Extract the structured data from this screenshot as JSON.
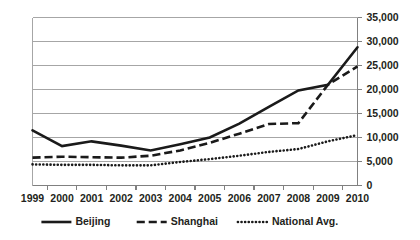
{
  "chart_data": {
    "type": "line",
    "title": "",
    "subtitle": "",
    "xlabel": "",
    "ylabel": "",
    "categories": [
      "1999",
      "2000",
      "2001",
      "2002",
      "2003",
      "2004",
      "2005",
      "2006",
      "2007",
      "2008",
      "2009",
      "2010"
    ],
    "ylim": [
      0,
      35000
    ],
    "ytick_values": [
      0,
      5000,
      10000,
      15000,
      20000,
      25000,
      30000,
      35000
    ],
    "ytick_labels": [
      "0",
      "5,000",
      "10,000",
      "15,000",
      "20,000",
      "25,000",
      "30,000",
      "35,000"
    ],
    "yaxis_position": "right",
    "grid": true,
    "grid_axis": "y",
    "legend_position": "bottom",
    "series": [
      {
        "name": "Beijing",
        "style": "solid",
        "color": "#1a1a1a",
        "width": 2.6,
        "values": [
          11500,
          8200,
          9200,
          8300,
          7300,
          8600,
          10000,
          12900,
          16400,
          19800,
          21000,
          28800
        ]
      },
      {
        "name": "Shanghai",
        "style": "dashed",
        "color": "#1a1a1a",
        "width": 2.6,
        "values": [
          5800,
          6000,
          5900,
          5800,
          6200,
          7300,
          8900,
          10800,
          12800,
          13000,
          21000,
          24800
        ]
      },
      {
        "name": "National Avg.",
        "style": "dotted",
        "color": "#1a1a1a",
        "width": 2.6,
        "values": [
          4400,
          4300,
          4300,
          4200,
          4200,
          4900,
          5500,
          6200,
          7000,
          7600,
          9200,
          10500
        ]
      }
    ]
  },
  "legend": {
    "items": [
      {
        "label": "Beijing",
        "marker": "solid-line-marker"
      },
      {
        "label": "Shanghai",
        "marker": "dashed-line-marker"
      },
      {
        "label": "National Avg.",
        "marker": "dotted-line-marker"
      }
    ]
  },
  "colors": {
    "background": "#ffffff",
    "ink": "#231f20",
    "grid": "#a6a6a6",
    "axis": "#808080",
    "series": "#1a1a1a"
  }
}
